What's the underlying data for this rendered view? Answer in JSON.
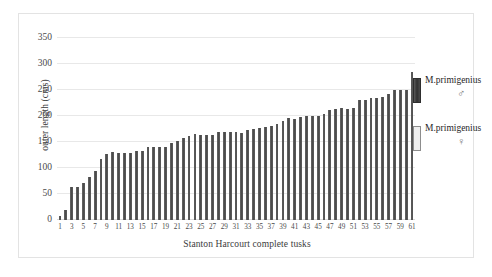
{
  "chart_data": {
    "type": "bar",
    "title": "",
    "subtitle": "",
    "xlabel": "Stanton Harcourt complete tusks",
    "ylabel": "outer length (cms)",
    "ylim": [
      0,
      350
    ],
    "ytick_step": 50,
    "yticks": [
      0,
      50,
      100,
      150,
      200,
      250,
      300,
      350
    ],
    "ytick_labels": [
      "0",
      "50",
      "100",
      "150",
      "200",
      "250",
      "300",
      "350"
    ],
    "grid": "horizontal",
    "legend_position": "right",
    "bar_color": "#555555",
    "gridline_color": "#e8e8e8",
    "categories": [
      "1",
      "2",
      "3",
      "4",
      "5",
      "6",
      "7",
      "8",
      "9",
      "10",
      "11",
      "12",
      "13",
      "14",
      "15",
      "16",
      "17",
      "18",
      "19",
      "20",
      "21",
      "22",
      "23",
      "24",
      "25",
      "26",
      "27",
      "28",
      "29",
      "30",
      "31",
      "32",
      "33",
      "34",
      "35",
      "36",
      "37",
      "38",
      "39",
      "40",
      "41",
      "42",
      "43",
      "44",
      "45",
      "46",
      "47",
      "48",
      "49",
      "50",
      "51",
      "52",
      "53",
      "54",
      "55",
      "56",
      "57",
      "58",
      "59",
      "60",
      "61"
    ],
    "xtick_labels_shown": [
      "1",
      "3",
      "5",
      "7",
      "9",
      "11",
      "13",
      "15",
      "17",
      "19",
      "21",
      "23",
      "25",
      "27",
      "29",
      "31",
      "33",
      "35",
      "37",
      "39",
      "41",
      "43",
      "45",
      "47",
      "49",
      "51",
      "53",
      "55",
      "57",
      "59",
      "61"
    ],
    "values": [
      7,
      20,
      64,
      64,
      71,
      82,
      95,
      117,
      126,
      130,
      129,
      129,
      128,
      132,
      133,
      141,
      141,
      141,
      141,
      149,
      152,
      157,
      161,
      165,
      164,
      164,
      164,
      169,
      170,
      170,
      169,
      168,
      174,
      175,
      177,
      178,
      180,
      184,
      190,
      196,
      195,
      199,
      200,
      200,
      200,
      204,
      211,
      214,
      215,
      214,
      216,
      230,
      231,
      235,
      235,
      236,
      243,
      250,
      250,
      250,
      285
    ],
    "series": [
      {
        "name": "M.primigenius",
        "sex": "male",
        "color": "#3f3f3f"
      },
      {
        "name": "M.primigenius",
        "sex": "female",
        "color": "#efefef"
      }
    ]
  },
  "legend": {
    "male": {
      "label": "M.primigenius",
      "symbol": "♂",
      "swatch_color": "#3f3f3f"
    },
    "female": {
      "label": "M.primigenius",
      "symbol": "♀",
      "swatch_color": "#efefef"
    }
  }
}
